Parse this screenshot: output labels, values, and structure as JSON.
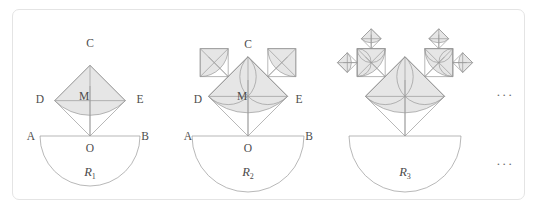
{
  "panel": {
    "title": "Recursive semicircular fractal sequence",
    "frame_color": "#e4e4e4",
    "background_color": "#ffffff"
  },
  "style": {
    "stroke_color": "#9a9a9a",
    "stroke_color_dark": "#8a8a8a",
    "shade_fill": "#e6e6e6",
    "shade_fill_light": "#ececec",
    "label_color": "#4c4c4c",
    "caption_color": "#4a4a4a",
    "stroke_width": "0.7"
  },
  "figures": [
    {
      "id": "figure-1",
      "caption": "R",
      "caption_subscript": "1",
      "caption_x": 90,
      "caption_y": 176,
      "center_x": 90,
      "baseline_y": 136,
      "radius": 50,
      "depth": 1,
      "labels": [
        {
          "text": "A",
          "x": 31,
          "y": 140,
          "name": "point-label-a"
        },
        {
          "text": "B",
          "x": 145,
          "y": 140,
          "name": "point-label-b"
        },
        {
          "text": "O",
          "x": 90,
          "y": 152,
          "name": "point-label-o"
        },
        {
          "text": "C",
          "x": 90,
          "y": 47,
          "name": "point-label-c"
        },
        {
          "text": "D",
          "x": 40,
          "y": 103,
          "name": "point-label-d"
        },
        {
          "text": "E",
          "x": 140,
          "y": 103,
          "name": "point-label-e"
        },
        {
          "text": "M",
          "x": 84,
          "y": 100,
          "name": "point-label-m"
        }
      ]
    },
    {
      "id": "figure-2",
      "caption": "R",
      "caption_subscript": "2",
      "caption_x": 248,
      "caption_y": 176,
      "center_x": 248,
      "baseline_y": 136,
      "radius": 56,
      "depth": 2,
      "labels": [
        {
          "text": "A",
          "x": 188,
          "y": 140,
          "name": "point-label-a"
        },
        {
          "text": "B",
          "x": 309,
          "y": 140,
          "name": "point-label-b"
        },
        {
          "text": "O",
          "x": 248,
          "y": 152,
          "name": "point-label-o"
        },
        {
          "text": "C",
          "x": 248,
          "y": 48,
          "name": "point-label-c"
        },
        {
          "text": "D",
          "x": 198,
          "y": 103,
          "name": "point-label-d"
        },
        {
          "text": "E",
          "x": 299,
          "y": 103,
          "name": "point-label-e"
        },
        {
          "text": "M",
          "x": 242,
          "y": 100,
          "name": "point-label-m"
        }
      ]
    },
    {
      "id": "figure-3",
      "caption": "R",
      "caption_subscript": "3",
      "caption_x": 405,
      "caption_y": 176,
      "center_x": 405,
      "baseline_y": 136,
      "radius": 56,
      "depth": 3,
      "labels": []
    }
  ],
  "ellipses": [
    {
      "text": "···",
      "x": 505,
      "y": 99,
      "name": "ellipsis-upper"
    },
    {
      "text": "···",
      "x": 505,
      "y": 168,
      "name": "ellipsis-lower"
    }
  ]
}
